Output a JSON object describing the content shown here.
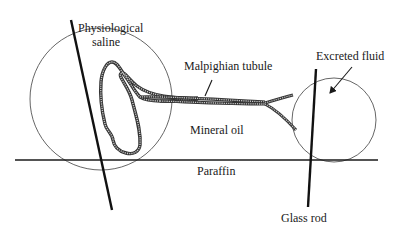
{
  "diagram": {
    "type": "experimental-setup",
    "labels": {
      "physiological_saline_line1": "Physiological",
      "physiological_saline_line2": "saline",
      "malpighian_tubule": "Malpighian tubule",
      "excreted_fluid": "Excreted fluid",
      "mineral_oil": "Mineral oil",
      "paraffin": "Paraffin",
      "glass_rod": "Glass rod"
    },
    "elements": [
      {
        "name": "saline-droplet",
        "shape": "circle",
        "cx": 101,
        "cy": 99,
        "r": 71
      },
      {
        "name": "excreted-fluid-droplet",
        "shape": "circle",
        "cx": 334,
        "cy": 120,
        "r": 42
      },
      {
        "name": "paraffin-surface",
        "shape": "line",
        "x1": 15,
        "y1": 160,
        "x2": 378,
        "y2": 160
      },
      {
        "name": "left-glass-rod",
        "shape": "line",
        "x1": 71,
        "y1": 20,
        "x2": 112,
        "y2": 210
      },
      {
        "name": "right-glass-rod",
        "shape": "line",
        "x1": 316,
        "y1": 69,
        "x2": 308,
        "y2": 207
      }
    ],
    "colors": {
      "ink": "#1a1a1a",
      "circle_stroke": "#555555",
      "tubule_outline": "#333333",
      "tubule_fill": "#bbbbbb",
      "background": "#ffffff"
    }
  }
}
